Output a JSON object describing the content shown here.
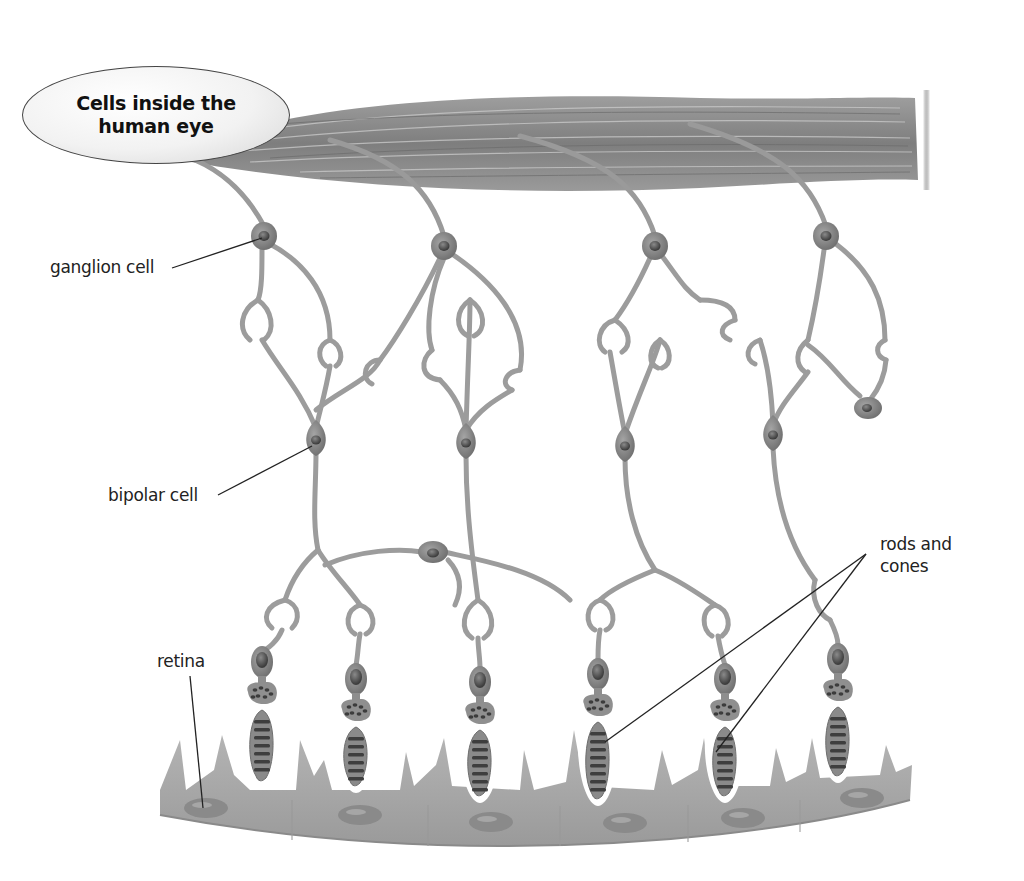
{
  "title": "Cells inside the human eye",
  "labels": {
    "ganglion": "ganglion cell",
    "bipolar": "bipolar cell",
    "rods_cones": "rods and cones",
    "retina": "retina"
  },
  "colors": {
    "background": "#ffffff",
    "cell_fill": "#9a9a9a",
    "cell_dark": "#6a6a6a",
    "nucleus": "#555555",
    "fiber_bundle": "#8c8c8c",
    "retina_layer": "#a8a8a8",
    "leader_line": "#222222",
    "text": "#222222"
  },
  "diagram": {
    "ganglion_cells": [
      {
        "x": 264,
        "y": 236
      },
      {
        "x": 444,
        "y": 246
      },
      {
        "x": 655,
        "y": 246
      },
      {
        "x": 826,
        "y": 236
      }
    ],
    "bipolar_cells": [
      {
        "x": 316,
        "y": 440
      },
      {
        "x": 466,
        "y": 443
      },
      {
        "x": 625,
        "y": 446
      },
      {
        "x": 773,
        "y": 435
      }
    ],
    "horizontal_cell": {
      "x": 433,
      "y": 552
    },
    "amacrine_cell": {
      "x": 868,
      "y": 408
    },
    "photoreceptors": [
      {
        "x": 262,
        "top": 648,
        "bottom": 780
      },
      {
        "x": 356,
        "top": 665,
        "bottom": 785
      },
      {
        "x": 480,
        "top": 668,
        "bottom": 795
      },
      {
        "x": 598,
        "top": 660,
        "bottom": 798
      },
      {
        "x": 725,
        "top": 665,
        "bottom": 795
      },
      {
        "x": 838,
        "top": 645,
        "bottom": 775
      }
    ],
    "retina_cells": [
      {
        "x": 206,
        "y": 808
      },
      {
        "x": 360,
        "y": 815
      },
      {
        "x": 491,
        "y": 822
      },
      {
        "x": 625,
        "y": 823
      },
      {
        "x": 743,
        "y": 818
      },
      {
        "x": 862,
        "y": 798
      }
    ]
  }
}
